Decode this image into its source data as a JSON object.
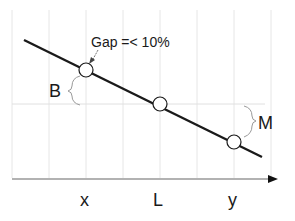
{
  "diagram": {
    "annotation": "Gap =< 10%",
    "brace_left_label": "B",
    "brace_right_label": "M",
    "axis_labels": [
      "x",
      "L",
      "y"
    ],
    "colors": {
      "line": "#1a1a1a",
      "grid": "#e2e2e2",
      "axis": "#555555",
      "brace": "#9a9a9a",
      "point_fill": "#ffffff"
    }
  }
}
